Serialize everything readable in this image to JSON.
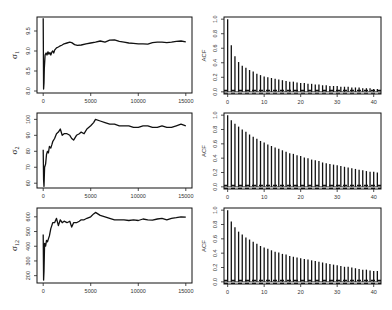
{
  "chart_data": [
    {
      "type": "line",
      "panel": "trace-sigma1",
      "ylabel": "σ₁",
      "ylabel_main": "σ",
      "ylabel_sub": "1",
      "xlim": [
        0,
        15000
      ],
      "ylim": [
        7.95,
        9.85
      ],
      "xticks": [
        0,
        5000,
        10000,
        15000
      ],
      "yticks": [
        8.0,
        8.5,
        9.0,
        9.5
      ],
      "ytick_labels": [
        "8.0",
        "8.5",
        "9.0",
        "9.5"
      ],
      "x": [
        0,
        40,
        80,
        120,
        200,
        300,
        400,
        500,
        600,
        700,
        800,
        900,
        1000,
        1100,
        1200,
        1400,
        1600,
        1800,
        2000,
        2200,
        2500,
        2800,
        3000,
        3300,
        3600,
        4000,
        4500,
        5000,
        5500,
        6000,
        6500,
        7000,
        7500,
        8000,
        8500,
        9000,
        9500,
        10000,
        10500,
        11000,
        11500,
        12000,
        12500,
        13000,
        13500,
        14000,
        14500,
        15000
      ],
      "y": [
        9.82,
        8.05,
        8.2,
        8.55,
        8.9,
        8.95,
        8.9,
        8.98,
        8.92,
        8.96,
        8.9,
        8.97,
        9.0,
        8.95,
        9.02,
        9.08,
        9.1,
        9.13,
        9.15,
        9.18,
        9.2,
        9.22,
        9.21,
        9.16,
        9.14,
        9.15,
        9.18,
        9.2,
        9.22,
        9.25,
        9.22,
        9.27,
        9.28,
        9.24,
        9.22,
        9.2,
        9.19,
        9.18,
        9.18,
        9.17,
        9.21,
        9.22,
        9.22,
        9.21,
        9.22,
        9.24,
        9.25,
        9.23
      ]
    },
    {
      "type": "bar",
      "panel": "acf-sigma1",
      "ylabel": "ACF",
      "xlim": [
        -1,
        42
      ],
      "ylim": [
        -0.03,
        1.03
      ],
      "xticks": [
        0,
        10,
        20,
        30,
        40
      ],
      "yticks": [
        0.0,
        0.2,
        0.4,
        0.6,
        0.8,
        1.0
      ],
      "ytick_labels": [
        "0.0",
        "0.2",
        "0.4",
        "0.6",
        "0.8",
        "1.0"
      ],
      "confidence_bound": 0.02,
      "lags": [
        0,
        1,
        2,
        3,
        4,
        5,
        6,
        7,
        8,
        9,
        10,
        11,
        12,
        13,
        14,
        15,
        16,
        17,
        18,
        19,
        20,
        21,
        22,
        23,
        24,
        25,
        26,
        27,
        28,
        29,
        30,
        31,
        32,
        33,
        34,
        35,
        36,
        37,
        38,
        39,
        40,
        41
      ],
      "values": [
        1.0,
        0.64,
        0.49,
        0.41,
        0.36,
        0.33,
        0.3,
        0.28,
        0.25,
        0.23,
        0.21,
        0.2,
        0.19,
        0.18,
        0.17,
        0.16,
        0.15,
        0.14,
        0.14,
        0.13,
        0.12,
        0.12,
        0.11,
        0.11,
        0.1,
        0.1,
        0.09,
        0.09,
        0.08,
        0.08,
        0.08,
        0.07,
        0.07,
        0.07,
        0.06,
        0.06,
        0.06,
        0.05,
        0.05,
        0.05,
        0.04,
        0.04
      ]
    },
    {
      "type": "line",
      "panel": "trace-sigma2",
      "ylabel": "σ₂",
      "ylabel_main": "σ",
      "ylabel_sub": "2",
      "xlim": [
        0,
        15000
      ],
      "ylim": [
        57,
        104
      ],
      "xticks": [
        0,
        5000,
        10000,
        15000
      ],
      "yticks": [
        60,
        70,
        80,
        90,
        100
      ],
      "ytick_labels": [
        "60",
        "70",
        "80",
        "90",
        "100"
      ],
      "x": [
        0,
        40,
        80,
        150,
        250,
        350,
        450,
        550,
        650,
        800,
        900,
        1000,
        1200,
        1400,
        1600,
        1800,
        2000,
        2200,
        2500,
        2800,
        3000,
        3200,
        3500,
        3800,
        4000,
        4300,
        4600,
        5000,
        5300,
        5500,
        6000,
        6500,
        7000,
        7500,
        8000,
        8500,
        9000,
        9500,
        10000,
        10500,
        11000,
        11500,
        12000,
        12500,
        13000,
        13500,
        14000,
        14500,
        15000
      ],
      "y": [
        81,
        62,
        58,
        70,
        72,
        78,
        80,
        79,
        83,
        82,
        84,
        86,
        88,
        91,
        92,
        94,
        90,
        91,
        91,
        90,
        88,
        87,
        90,
        91,
        92,
        91,
        94,
        96,
        98,
        100,
        99,
        98,
        97,
        97,
        96,
        96,
        96,
        95,
        95,
        96,
        96,
        95,
        95,
        96,
        95,
        95,
        96,
        97,
        96
      ]
    },
    {
      "type": "bar",
      "panel": "acf-sigma2",
      "ylabel": "ACF",
      "xlim": [
        -1,
        42
      ],
      "ylim": [
        -0.03,
        1.03
      ],
      "xticks": [
        0,
        10,
        20,
        30,
        40
      ],
      "yticks": [
        0.0,
        0.2,
        0.4,
        0.6,
        0.8,
        1.0
      ],
      "ytick_labels": [
        "0.0",
        "0.2",
        "0.4",
        "0.6",
        "0.8",
        "1.0"
      ],
      "confidence_bound": 0.02,
      "lags": [
        0,
        1,
        2,
        3,
        4,
        5,
        6,
        7,
        8,
        9,
        10,
        11,
        12,
        13,
        14,
        15,
        16,
        17,
        18,
        19,
        20,
        21,
        22,
        23,
        24,
        25,
        26,
        27,
        28,
        29,
        30,
        31,
        32,
        33,
        34,
        35,
        36,
        37,
        38,
        39,
        40,
        41
      ],
      "values": [
        1.0,
        0.93,
        0.88,
        0.84,
        0.8,
        0.77,
        0.73,
        0.7,
        0.67,
        0.64,
        0.62,
        0.59,
        0.57,
        0.55,
        0.53,
        0.51,
        0.49,
        0.47,
        0.46,
        0.44,
        0.43,
        0.41,
        0.4,
        0.38,
        0.37,
        0.36,
        0.34,
        0.33,
        0.32,
        0.31,
        0.3,
        0.29,
        0.28,
        0.27,
        0.26,
        0.25,
        0.24,
        0.23,
        0.22,
        0.21,
        0.21,
        0.2
      ]
    },
    {
      "type": "line",
      "panel": "trace-sigma12",
      "ylabel": "σ₁₂",
      "ylabel_main": "σ",
      "ylabel_sub": "12",
      "xlim": [
        0,
        15000
      ],
      "ylim": [
        150,
        660
      ],
      "xticks": [
        0,
        5000,
        10000,
        15000
      ],
      "yticks": [
        200,
        300,
        400,
        500,
        600
      ],
      "ytick_labels": [
        "200",
        "300",
        "400",
        "500",
        "600"
      ],
      "x": [
        0,
        40,
        80,
        150,
        250,
        350,
        450,
        550,
        650,
        800,
        900,
        1000,
        1200,
        1400,
        1600,
        1800,
        2000,
        2200,
        2500,
        2800,
        3000,
        3200,
        3500,
        3800,
        4000,
        4300,
        4600,
        5000,
        5300,
        5500,
        6000,
        6500,
        7000,
        7500,
        8000,
        8500,
        9000,
        9500,
        10000,
        10500,
        11000,
        11500,
        12000,
        12500,
        13000,
        13500,
        14000,
        14500,
        15000
      ],
      "y": [
        480,
        170,
        230,
        420,
        400,
        440,
        430,
        450,
        470,
        520,
        540,
        560,
        560,
        590,
        540,
        580,
        560,
        570,
        560,
        570,
        530,
        560,
        560,
        570,
        580,
        580,
        590,
        600,
        620,
        630,
        610,
        600,
        590,
        580,
        580,
        580,
        575,
        580,
        575,
        585,
        580,
        578,
        585,
        590,
        580,
        590,
        595,
        600,
        598
      ]
    },
    {
      "type": "bar",
      "panel": "acf-sigma12",
      "ylabel": "ACF",
      "xlim": [
        -1,
        42
      ],
      "ylim": [
        -0.03,
        1.03
      ],
      "xticks": [
        0,
        10,
        20,
        30,
        40
      ],
      "yticks": [
        0.0,
        0.2,
        0.4,
        0.6,
        0.8,
        1.0
      ],
      "ytick_labels": [
        "0.0",
        "0.2",
        "0.4",
        "0.6",
        "0.8",
        "1.0"
      ],
      "confidence_bound": 0.02,
      "lags": [
        0,
        1,
        2,
        3,
        4,
        5,
        6,
        7,
        8,
        9,
        10,
        11,
        12,
        13,
        14,
        15,
        16,
        17,
        18,
        19,
        20,
        21,
        22,
        23,
        24,
        25,
        26,
        27,
        28,
        29,
        30,
        31,
        32,
        33,
        34,
        35,
        36,
        37,
        38,
        39,
        40,
        41
      ],
      "values": [
        1.0,
        0.84,
        0.76,
        0.7,
        0.66,
        0.62,
        0.59,
        0.56,
        0.53,
        0.5,
        0.48,
        0.46,
        0.44,
        0.42,
        0.41,
        0.39,
        0.38,
        0.36,
        0.35,
        0.34,
        0.33,
        0.32,
        0.31,
        0.3,
        0.29,
        0.28,
        0.27,
        0.26,
        0.25,
        0.24,
        0.23,
        0.22,
        0.21,
        0.21,
        0.2,
        0.19,
        0.18,
        0.17,
        0.17,
        0.16,
        0.15,
        0.15
      ]
    }
  ],
  "layout": {
    "panels": [
      {
        "id": "trace-sigma1",
        "x0": 37,
        "y0": 17,
        "x1": 192,
        "y1": 93
      },
      {
        "id": "acf-sigma1",
        "x0": 224,
        "y0": 17,
        "x1": 381,
        "y1": 94
      },
      {
        "id": "trace-sigma2",
        "x0": 37,
        "y0": 113,
        "x1": 192,
        "y1": 188
      },
      {
        "id": "acf-sigma2",
        "x0": 224,
        "y0": 113,
        "x1": 381,
        "y1": 189
      },
      {
        "id": "trace-sigma12",
        "x0": 37,
        "y0": 208,
        "x1": 192,
        "y1": 283
      },
      {
        "id": "acf-sigma12",
        "x0": 224,
        "y0": 208,
        "x1": 381,
        "y1": 284
      }
    ]
  }
}
